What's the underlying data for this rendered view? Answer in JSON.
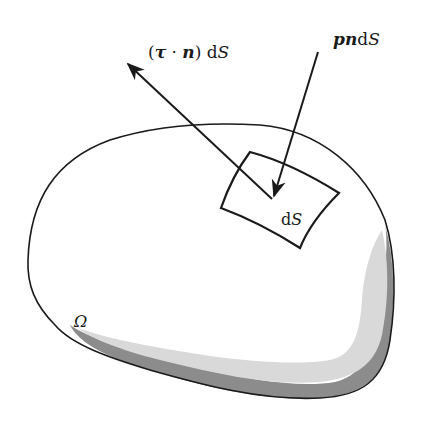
{
  "diagram": {
    "labels": {
      "traction_prefix": "(",
      "traction_tau": "τ",
      "traction_dot": " · ",
      "traction_n": "n",
      "traction_suffix": ") d",
      "traction_S": "S",
      "pressure_pn": "pn",
      "pressure_d": "d",
      "pressure_S": "S",
      "patch_d": "d",
      "patch_S": "S",
      "domain": "Ω"
    },
    "colors": {
      "stroke": "#1a1a1a",
      "shade_light": "#d9d9d9",
      "shade_dark": "#8c8c8c",
      "background": "#ffffff"
    },
    "elements": [
      {
        "id": "domain-boundary",
        "description": "closed blob outline of region Ω with shaded lower-right rim"
      },
      {
        "id": "surface-patch",
        "description": "curved quadrilateral surface element dS"
      },
      {
        "id": "traction-arrow",
        "description": "arrow from patch outward, labeled (τ·n)dS"
      },
      {
        "id": "pressure-arrow",
        "description": "arrow into patch, labeled pndS"
      }
    ]
  }
}
